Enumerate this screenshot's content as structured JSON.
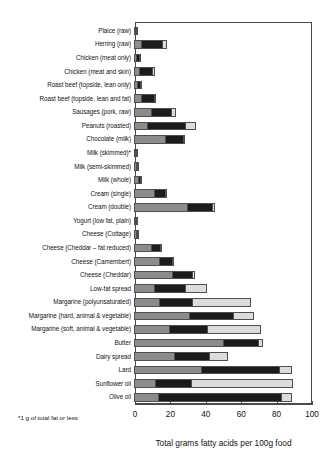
{
  "chart_data": {
    "type": "bar",
    "subtype": "horizontal-stacked",
    "title": "",
    "xlabel": "Total grams fatty acids per 100g food",
    "ylabel": "",
    "xlim": [
      0,
      100
    ],
    "xticks": [
      0,
      20,
      40,
      60,
      80,
      100
    ],
    "xtick_labels": [
      "0",
      "20",
      "40",
      "60",
      "80",
      "100"
    ],
    "grid": false,
    "legend_position": "none",
    "footnote": "*1 g of total fat or less",
    "units": "grams fatty acids per 100g food",
    "categories": [
      "Plaice (raw)",
      "Herring (raw)",
      "Chicken (meat only)",
      "Chicken (meat and skin)",
      "Roast beef (topside, lean only)",
      "Roast beef (topside, lean and fat)",
      "Sausages (pork, raw)",
      "Peanuts (roasted)",
      "Chocolate (milk)",
      "Milk (skimmed)*",
      "Milk (semi-skimmed)",
      "Milk (whole)",
      "Cream (single)",
      "Cream (double)",
      "Yogurt (low fat, plain)",
      "Cheese (Cottage)",
      "Cheese (Cheddar – fat reduced)",
      "Cheese (Camembert)",
      "Cheese (Cheddar)",
      "Low-fat spread",
      "Margarine (polyunsaturated)",
      "Margarine (hard, animal & vegetable)",
      "Margarine (soft, animal & vegetable)",
      "Butter",
      "Dairy spread",
      "Lard",
      "Sunflower oil",
      "Olive oil"
    ],
    "series": [
      {
        "name": "Saturated",
        "color": "#8c8c8c",
        "values": [
          0.2,
          4.0,
          1.0,
          3.0,
          1.5,
          4.0,
          9.5,
          7.5,
          17.5,
          0.1,
          1.0,
          2.3,
          11.5,
          30.0,
          0.6,
          1.2,
          9.5,
          14.0,
          21.5,
          11.5,
          14.0,
          31.0,
          20.0,
          50.0,
          22.5,
          38.0,
          12.0,
          13.5
        ]
      },
      {
        "name": "Monounsaturated",
        "color": "#1c1c1c",
        "values": [
          0.4,
          12.0,
          1.6,
          7.0,
          1.9,
          7.5,
          11.5,
          21.5,
          10.0,
          0.1,
          0.6,
          1.3,
          6.0,
          14.0,
          0.4,
          0.5,
          5.0,
          7.5,
          11.5,
          17.5,
          19.0,
          25.0,
          21.5,
          20.0,
          20.0,
          44.0,
          20.0,
          69.5
        ]
      },
      {
        "name": "Polyunsaturated",
        "color": "#dcdcdc",
        "values": [
          0.4,
          2.5,
          0.9,
          2.0,
          0.3,
          0.8,
          2.5,
          6.0,
          1.0,
          0.1,
          0.1,
          0.1,
          0.8,
          1.5,
          0.1,
          0.1,
          0.7,
          0.9,
          1.5,
          12.5,
          33.0,
          12.0,
          30.0,
          3.0,
          10.5,
          7.0,
          58.0,
          6.0
        ]
      }
    ]
  }
}
